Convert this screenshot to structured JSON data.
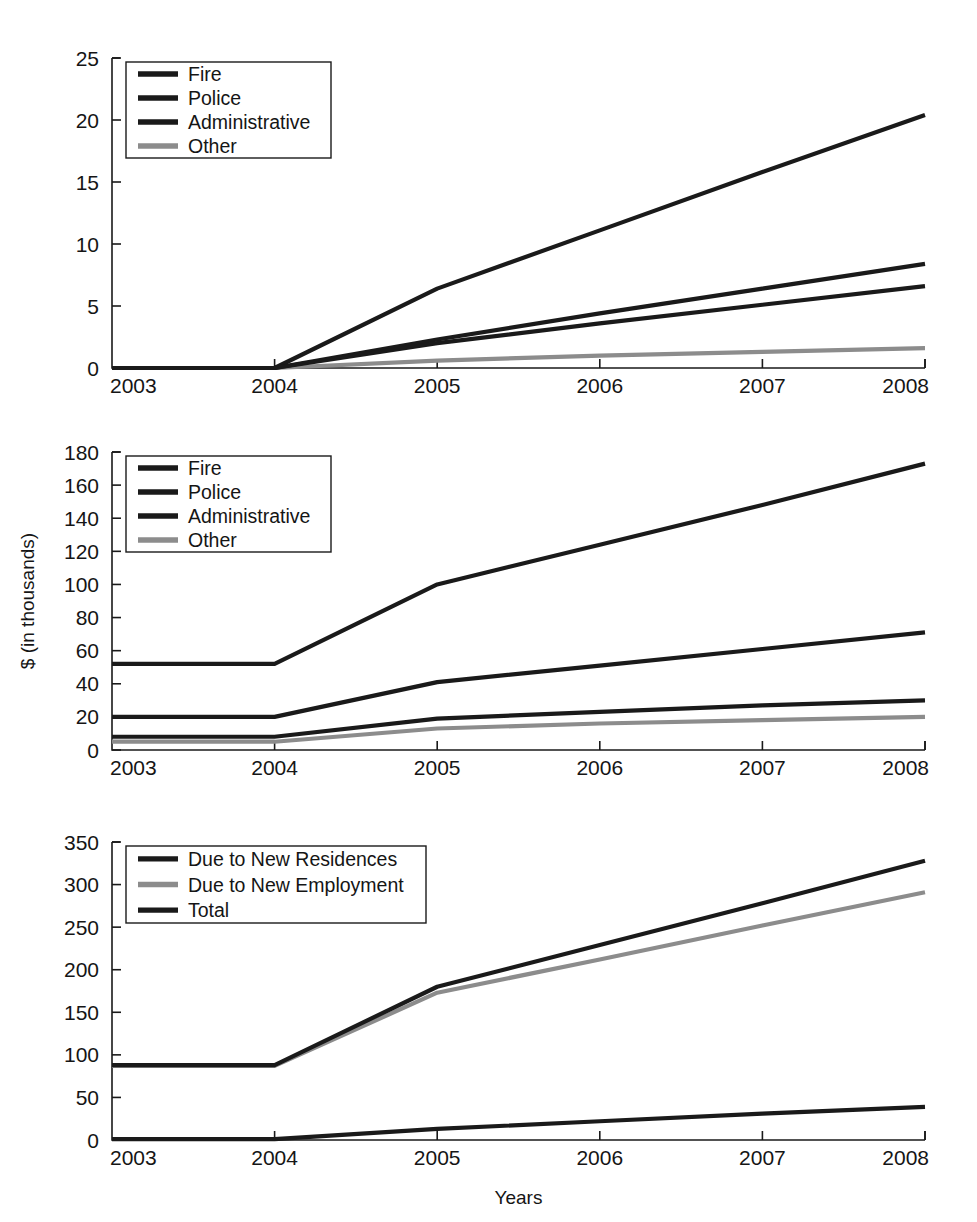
{
  "axes": {
    "xlabel": "Years",
    "ylabel": "$ (in thousands)",
    "xticks": [
      "2003",
      "2004",
      "2005",
      "2006",
      "2007",
      "2008"
    ]
  },
  "colors": {
    "dark": "#1a1a1a",
    "gray": "#8c8c8c",
    "background": "#ffffff",
    "axis": "#1a1a1a"
  },
  "chart_data": [
    {
      "id": "panel-top",
      "type": "line",
      "title": "",
      "xlabel": "",
      "ylabel": "",
      "grid": false,
      "legend_position": "upper left",
      "x": [
        2003,
        2004,
        2005,
        2006,
        2007,
        2008
      ],
      "xticklabels": [
        "2003",
        "2004",
        "2005",
        "2006",
        "2007",
        "2008"
      ],
      "xlim": [
        2003,
        2008
      ],
      "ylim": [
        0,
        25
      ],
      "yticks": [
        0,
        5,
        10,
        15,
        20,
        25
      ],
      "yticklabels": [
        "0",
        "5",
        "10",
        "15",
        "20",
        "25"
      ],
      "series": [
        {
          "name": "Fire",
          "color": "#1a1a1a",
          "values": [
            0,
            0,
            6.4,
            11.1,
            15.8,
            20.4
          ]
        },
        {
          "name": "Police",
          "color": "#1a1a1a",
          "values": [
            0,
            0,
            2.3,
            4.4,
            6.4,
            8.4
          ]
        },
        {
          "name": "Administrative",
          "color": "#1a1a1a",
          "values": [
            0,
            0,
            2.0,
            3.6,
            5.1,
            6.6
          ]
        },
        {
          "name": "Other",
          "color": "#8c8c8c",
          "values": [
            0,
            0,
            0.6,
            1.0,
            1.3,
            1.6
          ]
        }
      ]
    },
    {
      "id": "panel-middle",
      "type": "line",
      "title": "",
      "xlabel": "",
      "ylabel": "$ (in thousands)",
      "grid": false,
      "legend_position": "upper left",
      "x": [
        2003,
        2004,
        2005,
        2006,
        2007,
        2008
      ],
      "xticklabels": [
        "2003",
        "2004",
        "2005",
        "2006",
        "2007",
        "2008"
      ],
      "xlim": [
        2003,
        2008
      ],
      "ylim": [
        0,
        180
      ],
      "yticks": [
        0,
        20,
        40,
        60,
        80,
        100,
        120,
        140,
        160,
        180
      ],
      "yticklabels": [
        "0",
        "20",
        "40",
        "60",
        "80",
        "100",
        "120",
        "140",
        "160",
        "180"
      ],
      "series": [
        {
          "name": "Fire",
          "color": "#1a1a1a",
          "values": [
            52,
            52,
            100,
            124,
            148,
            173
          ]
        },
        {
          "name": "Police",
          "color": "#1a1a1a",
          "values": [
            20,
            20,
            41,
            51,
            61,
            71
          ]
        },
        {
          "name": "Administrative",
          "color": "#1a1a1a",
          "values": [
            8,
            8,
            19,
            23,
            27,
            30
          ]
        },
        {
          "name": "Other",
          "color": "#8c8c8c",
          "values": [
            5,
            5,
            13,
            16,
            18,
            20
          ]
        }
      ]
    },
    {
      "id": "panel-bottom",
      "type": "line",
      "title": "",
      "xlabel": "Years",
      "ylabel": "",
      "grid": false,
      "legend_position": "upper left",
      "x": [
        2003,
        2004,
        2005,
        2006,
        2007,
        2008
      ],
      "xticklabels": [
        "2003",
        "2004",
        "2005",
        "2006",
        "2007",
        "2008"
      ],
      "xlim": [
        2003,
        2008
      ],
      "ylim": [
        0,
        350
      ],
      "yticks": [
        0,
        50,
        100,
        150,
        200,
        250,
        300,
        350
      ],
      "yticklabels": [
        "0",
        "50",
        "100",
        "150",
        "200",
        "250",
        "300",
        "350"
      ],
      "series": [
        {
          "name": "Due to New Residences",
          "color": "#1a1a1a",
          "values": [
            1,
            1,
            13,
            22,
            31,
            39
          ]
        },
        {
          "name": "Due to New Employment",
          "color": "#8c8c8c",
          "values": [
            87,
            87,
            173,
            212,
            252,
            291
          ]
        },
        {
          "name": "Total",
          "color": "#1a1a1a",
          "values": [
            88,
            88,
            180,
            229,
            278,
            328
          ]
        }
      ]
    }
  ]
}
